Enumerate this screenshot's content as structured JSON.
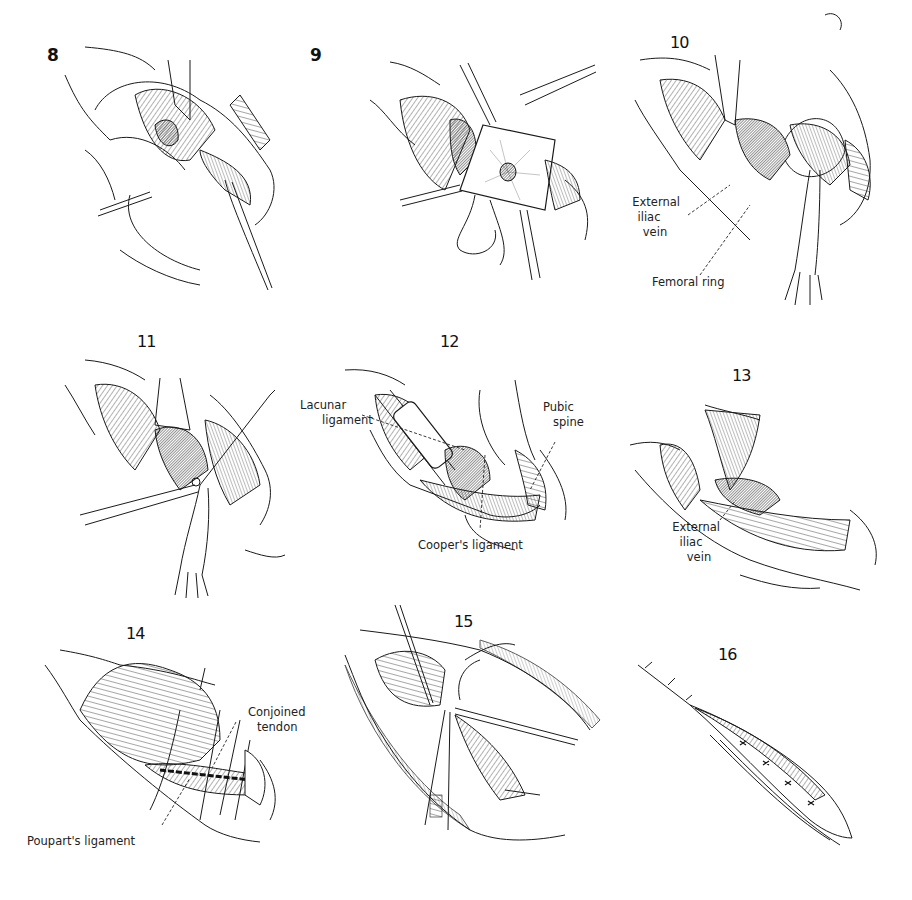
{
  "figure": {
    "type": "surgical-illustration-plate",
    "style": "black line-art on white",
    "colors": {
      "background": "#ffffff",
      "ink": "#1a1a1a"
    }
  },
  "panels": [
    {
      "number": "8",
      "callouts": []
    },
    {
      "number": "9",
      "callouts": []
    },
    {
      "number": "10",
      "callouts": [
        {
          "text_lines": [
            "External",
            "iliac",
            "vein"
          ]
        },
        {
          "text_lines": [
            "Femoral ring"
          ]
        }
      ]
    },
    {
      "number": "11",
      "callouts": []
    },
    {
      "number": "12",
      "callouts": [
        {
          "text_lines": [
            "Lacunar",
            "ligament"
          ]
        },
        {
          "text_lines": [
            "Pubic",
            "spine"
          ]
        },
        {
          "text_lines": [
            "Cooper's ligament"
          ]
        }
      ]
    },
    {
      "number": "13",
      "callouts": [
        {
          "text_lines": [
            "External",
            "iliac",
            "vein"
          ]
        }
      ]
    },
    {
      "number": "14",
      "callouts": [
        {
          "text_lines": [
            "Conjoined",
            "tendon"
          ]
        },
        {
          "text_lines": [
            "Poupart's ligament"
          ]
        }
      ]
    },
    {
      "number": "15",
      "callouts": []
    },
    {
      "number": "16",
      "callouts": []
    }
  ]
}
